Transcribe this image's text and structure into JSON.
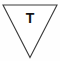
{
  "icon": {
    "name": "triangle-down-letter-t-icon",
    "shape": "inverted-triangle",
    "letter": "T",
    "stroke_color": "#3b3b3b",
    "fill_color": "#ffffff",
    "letter_color": "#141414",
    "background_color": "#fefefe",
    "geometry": {
      "top_left_x": 3,
      "top_right_x": 57,
      "top_y": 5,
      "apex_x": 30,
      "apex_y": 57.5
    }
  }
}
